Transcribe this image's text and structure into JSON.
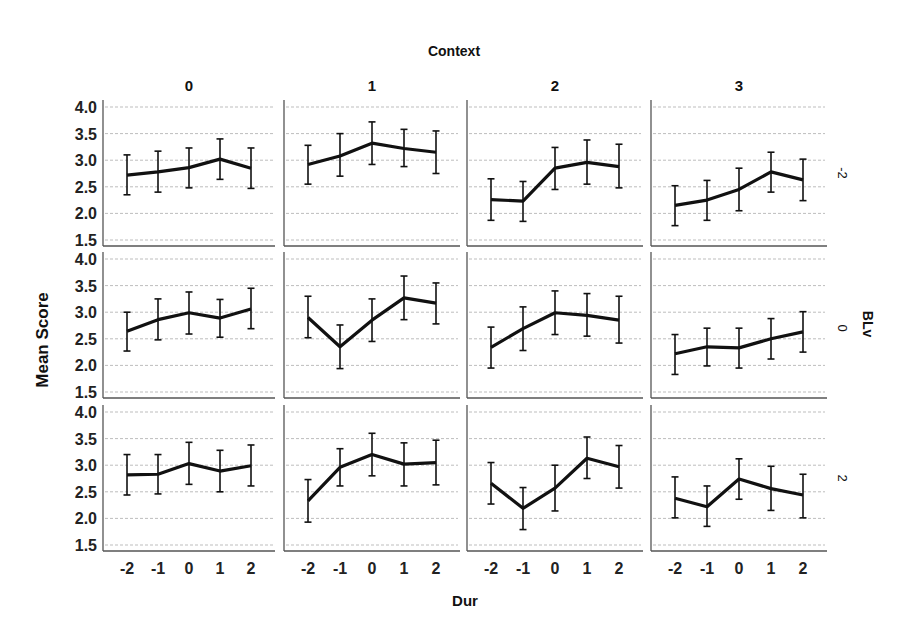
{
  "chart_data": {
    "type": "line",
    "title": "Context",
    "xlabel": "Dur",
    "ylabel": "Mean Score",
    "row_variable": "BLv",
    "column_variable": "Context",
    "x": [
      -2,
      -1,
      0,
      1,
      2
    ],
    "x_tick_labels": [
      "-2",
      "-1",
      "0",
      "1",
      "2"
    ],
    "ylim": [
      1.45,
      4.05
    ],
    "y_ticks": [
      1.5,
      2.0,
      2.5,
      3.0,
      3.5,
      4.0
    ],
    "y_tick_labels": [
      "1.5",
      "2.0",
      "2.5",
      "3.0",
      "3.5",
      "4.0"
    ],
    "grid": true,
    "error_bars": true,
    "columns": [
      "0",
      "1",
      "2",
      "3"
    ],
    "rows": [
      "-2",
      "0",
      "2"
    ],
    "panels": [
      {
        "row": "-2",
        "column": "0",
        "values": [
          2.72,
          2.78,
          2.86,
          3.02,
          2.85
        ],
        "lower": [
          2.35,
          2.4,
          2.48,
          2.64,
          2.47
        ],
        "upper": [
          3.1,
          3.17,
          3.23,
          3.4,
          3.23
        ]
      },
      {
        "row": "-2",
        "column": "1",
        "values": [
          2.92,
          3.08,
          3.32,
          3.22,
          3.15
        ],
        "lower": [
          2.55,
          2.7,
          2.92,
          2.88,
          2.75
        ],
        "upper": [
          3.28,
          3.5,
          3.72,
          3.58,
          3.55
        ]
      },
      {
        "row": "-2",
        "column": "2",
        "values": [
          2.26,
          2.23,
          2.85,
          2.96,
          2.88
        ],
        "lower": [
          1.87,
          1.85,
          2.45,
          2.55,
          2.48
        ],
        "upper": [
          2.65,
          2.6,
          3.24,
          3.38,
          3.3
        ]
      },
      {
        "row": "-2",
        "column": "3",
        "values": [
          2.15,
          2.25,
          2.45,
          2.78,
          2.63
        ],
        "lower": [
          1.77,
          1.87,
          2.05,
          2.4,
          2.24
        ],
        "upper": [
          2.52,
          2.62,
          2.85,
          3.15,
          3.02
        ]
      },
      {
        "row": "0",
        "column": "0",
        "values": [
          2.64,
          2.86,
          2.99,
          2.89,
          3.06
        ],
        "lower": [
          2.27,
          2.48,
          2.59,
          2.53,
          2.69
        ],
        "upper": [
          3.0,
          3.25,
          3.38,
          3.24,
          3.45
        ]
      },
      {
        "row": "0",
        "column": "1",
        "values": [
          2.9,
          2.35,
          2.85,
          3.27,
          3.17
        ],
        "lower": [
          2.52,
          1.94,
          2.45,
          2.86,
          2.78
        ],
        "upper": [
          3.3,
          2.76,
          3.25,
          3.68,
          3.55
        ]
      },
      {
        "row": "0",
        "column": "2",
        "values": [
          2.34,
          2.69,
          2.99,
          2.94,
          2.85
        ],
        "lower": [
          1.95,
          2.28,
          2.58,
          2.55,
          2.42
        ],
        "upper": [
          2.72,
          3.1,
          3.4,
          3.35,
          3.3
        ]
      },
      {
        "row": "0",
        "column": "3",
        "values": [
          2.22,
          2.35,
          2.33,
          2.5,
          2.63
        ],
        "lower": [
          1.83,
          1.99,
          1.95,
          2.12,
          2.25
        ],
        "upper": [
          2.58,
          2.7,
          2.7,
          2.88,
          3.01
        ]
      },
      {
        "row": "2",
        "column": "0",
        "values": [
          2.82,
          2.83,
          3.03,
          2.89,
          2.99
        ],
        "lower": [
          2.44,
          2.46,
          2.64,
          2.5,
          2.61
        ],
        "upper": [
          3.2,
          3.2,
          3.43,
          3.28,
          3.38
        ]
      },
      {
        "row": "2",
        "column": "1",
        "values": [
          2.33,
          2.96,
          3.2,
          3.02,
          3.05
        ],
        "lower": [
          1.93,
          2.61,
          2.8,
          2.61,
          2.63
        ],
        "upper": [
          2.73,
          3.31,
          3.6,
          3.42,
          3.47
        ]
      },
      {
        "row": "2",
        "column": "2",
        "values": [
          2.66,
          2.19,
          2.57,
          3.13,
          2.97
        ],
        "lower": [
          2.27,
          1.79,
          2.14,
          2.75,
          2.57
        ],
        "upper": [
          3.05,
          2.58,
          3.0,
          3.53,
          3.37
        ]
      },
      {
        "row": "2",
        "column": "3",
        "values": [
          2.38,
          2.22,
          2.74,
          2.56,
          2.44
        ],
        "lower": [
          2.01,
          1.85,
          2.36,
          2.15,
          2.01
        ],
        "upper": [
          2.78,
          2.61,
          3.12,
          2.98,
          2.83
        ]
      }
    ]
  }
}
